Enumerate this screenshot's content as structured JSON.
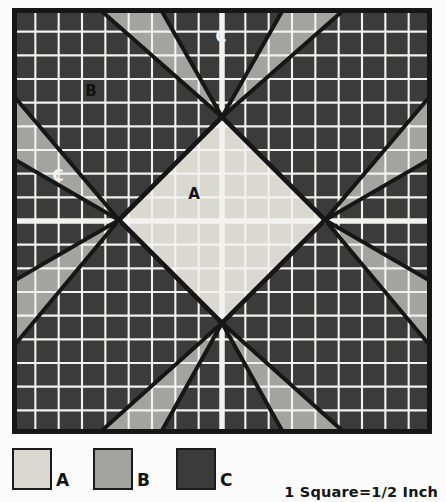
{
  "diagram": {
    "frame": {
      "x": 12,
      "y": 8,
      "width": 420,
      "height": 426,
      "border_color": "#161616",
      "border_width": 5
    },
    "grid": {
      "columns": 18,
      "rows": 18,
      "line_color": "#f2f2f0",
      "line_width": 2.1,
      "center_line_width": 5.5
    },
    "colors": {
      "a": "#d9d9d2",
      "b": "#a3a3a0",
      "c": "#3b3b3b",
      "outline": "#161616",
      "grid_line": "#f2f2f0"
    },
    "labels": [
      {
        "text": "C",
        "x": 221,
        "y": 42,
        "color": "#f4f4f2"
      },
      {
        "text": "B",
        "x": 91,
        "y": 96,
        "color": "#121212"
      },
      {
        "text": "C",
        "x": 58,
        "y": 181,
        "color": "#f4f4f2"
      },
      {
        "text": "A",
        "x": 194,
        "y": 199,
        "color": "#121212"
      }
    ],
    "center": {
      "x": 222,
      "y": 220
    },
    "diamond_radius": 103
  },
  "legend": {
    "items": [
      {
        "key": "A",
        "label": "A",
        "color": "#d9d9d2",
        "x": 12
      },
      {
        "key": "B",
        "label": "B",
        "color": "#a3a3a0",
        "x": 93
      },
      {
        "key": "C",
        "label": "C",
        "color": "#3b3b3b",
        "x": 176
      }
    ],
    "scale_note": "1 Square=1/2 Inch"
  },
  "chart_data": {
    "type": "diagram",
    "grid_columns": 18,
    "grid_rows": 18,
    "scale": "1 Square = 1/2 Inch",
    "regions": [
      {
        "id": "A",
        "description": "center diamond",
        "color": "#d9d9d2"
      },
      {
        "id": "B",
        "description": "corner background squares",
        "color": "#a3a3a0"
      },
      {
        "id": "C",
        "description": "star points / rays",
        "color": "#3b3b3b"
      }
    ],
    "legend_entries": [
      "A",
      "B",
      "C"
    ]
  }
}
